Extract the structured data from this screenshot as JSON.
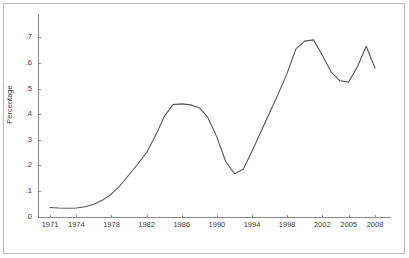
{
  "figure": {
    "background_color": "#ffffff",
    "frame_color": "#b9b9b9",
    "axis_color": "#8a8a8a",
    "line_color": "#555555",
    "ylabel": "Percentage"
  },
  "chart_data": {
    "type": "line",
    "title": "",
    "xlabel": "",
    "ylabel": "Percentage",
    "grid": false,
    "legend": false,
    "xlim": [
      1971,
      2008
    ],
    "ylim": [
      0,
      0.7
    ],
    "ytick_labels": [
      ".7",
      ".6",
      ".5",
      ".4",
      ".3",
      ".2",
      ".1",
      "0"
    ],
    "ytick_values": [
      0.7,
      0.6,
      0.5,
      0.4,
      0.3,
      0.2,
      0.1,
      0
    ],
    "xtick_labels": [
      "1971",
      "1974",
      "1978",
      "1982",
      "1986",
      "1990",
      "1994",
      "1998",
      "2002",
      "2005",
      "2008"
    ],
    "xtick_values": [
      1971,
      1974,
      1978,
      1982,
      1986,
      1990,
      1994,
      1998,
      2002,
      2005,
      2008
    ],
    "x": [
      1971,
      1972,
      1973,
      1974,
      1975,
      1976,
      1977,
      1978,
      1979,
      1980,
      1981,
      1982,
      1983,
      1984,
      1985,
      1986,
      1987,
      1988,
      1989,
      1990,
      1991,
      1992,
      1993,
      1994,
      1995,
      1996,
      1997,
      1998,
      1999,
      2000,
      2001,
      2002,
      2003,
      2004,
      2005,
      2006,
      2007,
      2008
    ],
    "values": [
      0.035,
      0.033,
      0.032,
      0.033,
      0.038,
      0.048,
      0.064,
      0.088,
      0.122,
      0.163,
      0.205,
      0.25,
      0.315,
      0.39,
      0.437,
      0.44,
      0.436,
      0.425,
      0.385,
      0.31,
      0.215,
      0.167,
      0.185,
      0.255,
      0.33,
      0.405,
      0.48,
      0.56,
      0.655,
      0.685,
      0.69,
      0.63,
      0.565,
      0.53,
      0.525,
      0.585,
      0.665,
      0.58
    ],
    "series": [
      {
        "name": "Percentage",
        "values": [
          0.035,
          0.033,
          0.032,
          0.033,
          0.038,
          0.048,
          0.064,
          0.088,
          0.122,
          0.163,
          0.205,
          0.25,
          0.315,
          0.39,
          0.437,
          0.44,
          0.436,
          0.425,
          0.385,
          0.31,
          0.215,
          0.167,
          0.185,
          0.255,
          0.33,
          0.405,
          0.48,
          0.56,
          0.655,
          0.685,
          0.69,
          0.63,
          0.565,
          0.53,
          0.525,
          0.585,
          0.665,
          0.58
        ]
      }
    ]
  }
}
